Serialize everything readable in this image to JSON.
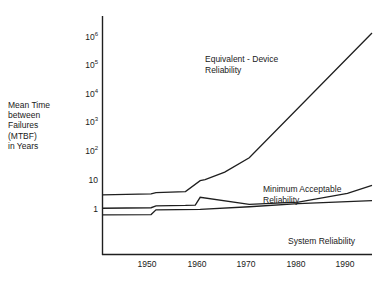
{
  "chart_data": {
    "type": "line",
    "title": "",
    "xlabel": "",
    "ylabel": "Mean Time between Failures (MTBF) in Years",
    "xticklabels": [
      "1950",
      "1960",
      "1970",
      "1980",
      "1990"
    ],
    "xtickvalues": [
      1950,
      1960,
      1970,
      1980,
      1990
    ],
    "yticklabels": [
      "1",
      "10",
      "10^2",
      "10^3",
      "10^4",
      "10^5",
      "10^6"
    ],
    "ytickvalues": [
      1,
      10,
      100,
      1000,
      10000,
      100000,
      1000000
    ],
    "ylim": [
      0.35,
      4000000
    ],
    "xlim": [
      1940,
      1995
    ],
    "yscale": "log",
    "grid": false,
    "legend_position": "inline-annotations",
    "series": [
      {
        "name": "Equivalent - Device Reliability",
        "x": [
          1940,
          1950,
          1951,
          1957,
          1960,
          1961,
          1965,
          1970,
          1995
        ],
        "y": [
          3.5,
          3.8,
          4.2,
          4.6,
          11,
          12,
          22,
          70,
          1600000
        ]
      },
      {
        "name": "Minimum Acceptable Reliability",
        "x": [
          1940,
          1950,
          1951,
          1957,
          1959,
          1960,
          1970,
          1980,
          1990,
          1995
        ],
        "y": [
          1.2,
          1.25,
          1.45,
          1.5,
          1.55,
          2.9,
          1.65,
          1.95,
          4.0,
          7.5
        ]
      },
      {
        "name": "System Reliability",
        "x": [
          1940,
          1950,
          1951,
          1960,
          1970,
          1980,
          1990,
          1995
        ],
        "y": [
          0.7,
          0.72,
          1.05,
          1.1,
          1.35,
          1.75,
          2.05,
          2.2
        ]
      }
    ],
    "annotations": [
      {
        "id": "equivalent-device",
        "text": "Equivalent - Device\nReliability",
        "x": 1964,
        "y": 120000
      },
      {
        "id": "minimum-acceptable",
        "text": "Minimum Acceptable\nReliability",
        "x": 1977,
        "y": 16
      },
      {
        "id": "system-reliability",
        "text": "System Reliability",
        "x": 1984,
        "y": 1.1
      }
    ]
  },
  "axis": {
    "y_label_text": "Mean Time\nbetween\nFailures\n(MTBF)\nin Years",
    "y_ticks": [
      {
        "mantissa": "10",
        "exponent": "6",
        "y": 38
      },
      {
        "mantissa": "10",
        "exponent": "5",
        "y": 66.5
      },
      {
        "mantissa": "10",
        "exponent": "4",
        "y": 95
      },
      {
        "mantissa": "10",
        "exponent": "3",
        "y": 123.5
      },
      {
        "mantissa": "10",
        "exponent": "2",
        "y": 152
      },
      {
        "mantissa": "10",
        "exponent": "",
        "y": 181
      },
      {
        "mantissa": "1",
        "exponent": "",
        "y": 210
      }
    ],
    "x_ticks": [
      {
        "label": "1950",
        "x": 147
      },
      {
        "label": "1960",
        "x": 197
      },
      {
        "label": "1970",
        "x": 246
      },
      {
        "label": "1980",
        "x": 296
      },
      {
        "label": "1990",
        "x": 345
      }
    ]
  },
  "annotations": {
    "equivalent_device": "Equivalent - Device\nReliability",
    "minimum_acceptable": "Minimum Acceptable\nReliability",
    "system_reliability": "System Reliability"
  },
  "caption": "",
  "colors": {
    "background": "#ffffff",
    "line": "#1f1f1f",
    "axis": "#1f1f1f",
    "text": "#1a1a1a"
  }
}
